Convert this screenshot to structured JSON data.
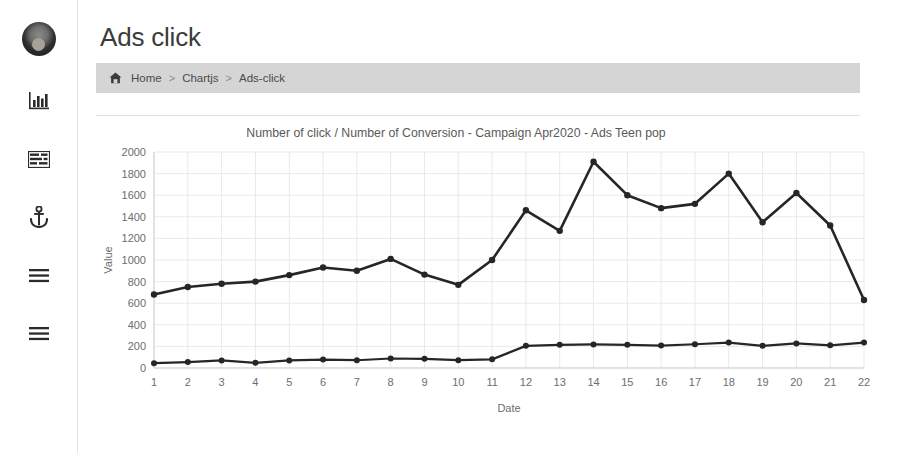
{
  "app": {
    "page_title": "Ads click"
  },
  "sidebar": {
    "items": [
      {
        "name": "avatar",
        "label": "user-avatar"
      },
      {
        "name": "bar-chart-icon",
        "label": "Charts"
      },
      {
        "name": "table-icon",
        "label": "Tables"
      },
      {
        "name": "anchor-icon",
        "label": "Anchor"
      },
      {
        "name": "menu-icon",
        "label": "Menu"
      },
      {
        "name": "list-icon",
        "label": "List"
      }
    ]
  },
  "breadcrumb": {
    "home_icon": "home-icon",
    "items": [
      "Home",
      "Chartjs",
      "Ads-click"
    ],
    "separator": ">"
  },
  "chart_data": {
    "type": "line",
    "title": "Number of click / Number of Conversion - Campaign Apr2020 - Ads Teen pop",
    "xlabel": "Date",
    "ylabel": "Value",
    "categories": [
      "1",
      "2",
      "3",
      "4",
      "5",
      "6",
      "7",
      "8",
      "9",
      "10",
      "11",
      "12",
      "13",
      "14",
      "15",
      "16",
      "17",
      "18",
      "19",
      "20",
      "21",
      "22"
    ],
    "ylim": [
      0,
      2000
    ],
    "ytick_step": 200,
    "yticks": [
      "0",
      "200",
      "400",
      "600",
      "800",
      "1000",
      "1200",
      "1400",
      "1600",
      "1800",
      "2000"
    ],
    "grid": true,
    "legend": "none",
    "series": [
      {
        "name": "Number of click",
        "color": "#262626",
        "values": [
          680,
          750,
          780,
          800,
          860,
          930,
          900,
          1010,
          865,
          770,
          1000,
          1460,
          1270,
          1910,
          1600,
          1480,
          1520,
          1800,
          1350,
          1620,
          1320,
          630
        ]
      },
      {
        "name": "Number of Conversion",
        "color": "#262626",
        "values": [
          45,
          55,
          70,
          48,
          70,
          78,
          72,
          88,
          85,
          72,
          80,
          205,
          215,
          218,
          215,
          208,
          220,
          235,
          205,
          228,
          210,
          235
        ]
      }
    ],
    "series2_tail": [
      140
    ]
  }
}
